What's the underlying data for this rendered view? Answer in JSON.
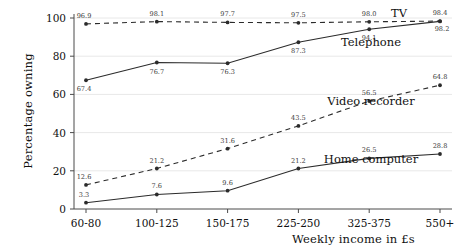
{
  "chart_data": {
    "type": "line",
    "title": "",
    "xlabel": "Weekly income in £s",
    "ylabel": "Percentage owning",
    "categories": [
      "60-80",
      "100-125",
      "150-175",
      "225-250",
      "325-375",
      "550+"
    ],
    "ylim": [
      0,
      100
    ],
    "yticks": [
      0,
      20,
      40,
      60,
      80,
      100
    ],
    "grid": true,
    "legend_position": "inline-right-of-series",
    "series": [
      {
        "name": "TV",
        "style": "dashed",
        "color": "#2b2b2b",
        "values": [
          96.9,
          98.1,
          97.7,
          97.5,
          98.0,
          98.4
        ],
        "labels": [
          "96.9",
          "98.1",
          "97.7",
          "97.5",
          "98.0",
          "98.4"
        ]
      },
      {
        "name": "Telephone",
        "style": "solid",
        "color": "#2b2b2b",
        "values": [
          67.4,
          76.7,
          76.3,
          87.3,
          94.1,
          98.2
        ],
        "labels": [
          "67.4",
          "76.7",
          "76.3",
          "87.3",
          "94.1",
          "98.2"
        ]
      },
      {
        "name": "Video recorder",
        "style": "dashed",
        "color": "#2b2b2b",
        "values": [
          12.6,
          21.2,
          31.6,
          43.5,
          56.5,
          64.8
        ],
        "labels": [
          "12.6",
          "21.2",
          "31.6",
          "43.5",
          "56.5",
          "64.8"
        ]
      },
      {
        "name": "Home computer",
        "style": "solid",
        "color": "#2b2b2b",
        "values": [
          3.3,
          7.6,
          9.6,
          21.2,
          26.5,
          28.8
        ],
        "labels": [
          "3.3",
          "7.6",
          "9.6",
          "21.2",
          "26.5",
          "28.8"
        ]
      }
    ],
    "series_label_positions": [
      {
        "name": "TV",
        "x": 399,
        "y": 17
      },
      {
        "name": "Telephone",
        "x": 371,
        "y": 46
      },
      {
        "name": "Video recorder",
        "x": 371,
        "y": 105
      },
      {
        "name": "Home computer",
        "x": 371,
        "y": 163
      }
    ],
    "label_offsets": {
      "TV": [
        [
          -2,
          -6
        ],
        [
          0,
          -6
        ],
        [
          0,
          -6
        ],
        [
          0,
          -6
        ],
        [
          0,
          -6
        ],
        [
          0,
          -6
        ]
      ],
      "Telephone": [
        [
          -2,
          11
        ],
        [
          0,
          11
        ],
        [
          0,
          11
        ],
        [
          0,
          11
        ],
        [
          0,
          11
        ],
        [
          2,
          10
        ]
      ],
      "Video recorder": [
        [
          -2,
          -6
        ],
        [
          0,
          -6
        ],
        [
          0,
          -6
        ],
        [
          0,
          -6
        ],
        [
          0,
          -6
        ],
        [
          0,
          -6
        ]
      ],
      "Home computer": [
        [
          -2,
          -6
        ],
        [
          0,
          -6
        ],
        [
          0,
          -6
        ],
        [
          0,
          -6
        ],
        [
          0,
          -6
        ],
        [
          0,
          -6
        ]
      ]
    }
  }
}
